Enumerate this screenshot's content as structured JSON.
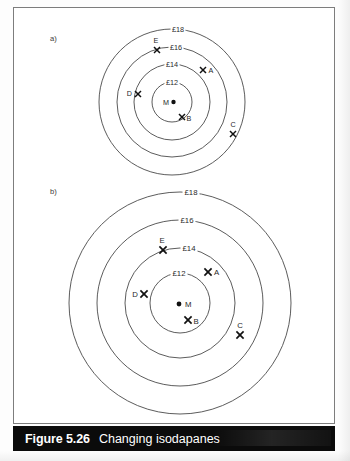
{
  "figure": {
    "caption_number": "Figure 5.26",
    "caption_title": "Changing isodapanes",
    "caption_bar_color": "#0b0b0b",
    "caption_text_color": "#ffffff",
    "frame_color": "#7d7d7d",
    "background_color": "#ffffff",
    "ring_color": "#4a4a4a",
    "marker_color": "#111111"
  },
  "panels": [
    {
      "id": "a",
      "label": "a)",
      "label_x": 50,
      "label_y": 41,
      "center": {
        "x": 172,
        "y": 102
      },
      "center_marker": {
        "name": "M",
        "label": "M",
        "dot_x": 173.5,
        "dot_y": 102,
        "dot_r": 2.2,
        "label_x": 163,
        "label_y": 104.5,
        "anchor": "start"
      },
      "rings": [
        {
          "value": "£12",
          "radius": 20,
          "label_x": 172,
          "label_y": 84.5,
          "anchor": "middle"
        },
        {
          "value": "£14",
          "radius": 38,
          "label_x": 172,
          "label_y": 66.5,
          "anchor": "middle"
        },
        {
          "value": "£16",
          "radius": 55,
          "label_x": 176,
          "label_y": 49.5,
          "anchor": "middle"
        },
        {
          "value": "£18",
          "radius": 73,
          "label_x": 178,
          "label_y": 31.5,
          "anchor": "middle"
        }
      ],
      "points": [
        {
          "name": "A",
          "label": "A",
          "x": 203,
          "y": 70,
          "label_x": 208.5,
          "label_y": 72.5,
          "anchor": "start"
        },
        {
          "name": "B",
          "label": "B",
          "x": 182,
          "y": 117,
          "label_x": 186.5,
          "label_y": 121,
          "anchor": "start"
        },
        {
          "name": "C",
          "label": "C",
          "x": 233,
          "y": 134,
          "label_x": 233,
          "label_y": 127,
          "anchor": "middle"
        },
        {
          "name": "D",
          "label": "D",
          "x": 138,
          "y": 94,
          "label_x": 132,
          "label_y": 95.5,
          "anchor": "end"
        },
        {
          "name": "E",
          "label": "E",
          "x": 157,
          "y": 50,
          "label_x": 156,
          "label_y": 43,
          "anchor": "middle"
        }
      ]
    },
    {
      "id": "b",
      "label": "b)",
      "label_x": 50,
      "label_y": 194,
      "center": {
        "x": 180,
        "y": 303
      },
      "center_marker": {
        "name": "M",
        "label": "M",
        "dot_x": 179,
        "dot_y": 304,
        "dot_r": 2.4,
        "label_x": 185,
        "label_y": 306.5,
        "anchor": "start"
      },
      "rings": [
        {
          "value": "£12",
          "radius": 30,
          "label_x": 179,
          "label_y": 275.5,
          "anchor": "middle"
        },
        {
          "value": "£14",
          "radius": 55,
          "label_x": 189,
          "label_y": 250.5,
          "anchor": "middle"
        },
        {
          "value": "£16",
          "radius": 83,
          "label_x": 187,
          "label_y": 222.5,
          "anchor": "middle"
        },
        {
          "value": "£18",
          "radius": 111,
          "label_x": 191,
          "label_y": 194.5,
          "anchor": "middle"
        }
      ],
      "points": [
        {
          "name": "A",
          "label": "A",
          "x": 208,
          "y": 272,
          "label_x": 214,
          "label_y": 275,
          "anchor": "start"
        },
        {
          "name": "B",
          "label": "B",
          "x": 188,
          "y": 320,
          "label_x": 193.5,
          "label_y": 323.5,
          "anchor": "start"
        },
        {
          "name": "C",
          "label": "C",
          "x": 240,
          "y": 335,
          "label_x": 240,
          "label_y": 328,
          "anchor": "middle"
        },
        {
          "name": "D",
          "label": "D",
          "x": 144,
          "y": 294,
          "label_x": 138,
          "label_y": 296.5,
          "anchor": "end"
        },
        {
          "name": "E",
          "label": "E",
          "x": 163,
          "y": 250,
          "label_x": 162,
          "label_y": 243,
          "anchor": "middle"
        }
      ]
    }
  ]
}
